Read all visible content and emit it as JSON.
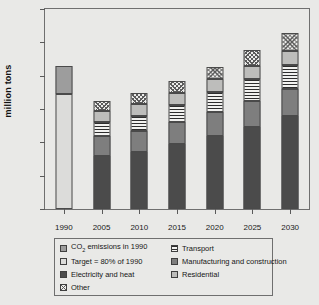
{
  "chart_data": {
    "type": "bar",
    "subtype": "stacked-bar",
    "title": "",
    "xlabel": "",
    "ylabel": "million tons",
    "categories": [
      "1990",
      "2005",
      "2010",
      "2015",
      "2020",
      "2025",
      "2030"
    ],
    "ylim": [
      0,
      6000
    ],
    "ytick_values": [
      0,
      1000,
      2000,
      3000,
      4000,
      5000,
      6000
    ],
    "ytick_labels": [
      "0",
      "1,000",
      "2,000",
      "3,000",
      "4,000",
      "5,000",
      "6,000"
    ],
    "grid": false,
    "legend_position": "bottom",
    "series": [
      {
        "name": "CO2 emissions in 1990",
        "key": "co2_1990",
        "fill": "#9d9d9d",
        "values": [
          860,
          0,
          0,
          0,
          0,
          0,
          0
        ]
      },
      {
        "name": "Target = 80% of 1990",
        "key": "target_80",
        "fill": "#dcdcda",
        "values": [
          3440,
          0,
          0,
          0,
          0,
          0,
          0
        ]
      },
      {
        "name": "Electricity and heat",
        "key": "electricity_heat",
        "fill": "#4b4b4b",
        "values": [
          0,
          1600,
          1710,
          1950,
          2200,
          2470,
          2780
        ]
      },
      {
        "name": "Manufacturing and construction",
        "key": "manufacturing_construction",
        "fill": "#7e7e7e",
        "values": [
          0,
          580,
          620,
          650,
          700,
          780,
          820
        ]
      },
      {
        "name": "Transport",
        "key": "transport",
        "fill": "horizontal-stripes",
        "values": [
          0,
          430,
          470,
          530,
          610,
          650,
          720
        ]
      },
      {
        "name": "Residential",
        "key": "residential",
        "fill": "#bdbdbb",
        "values": [
          0,
          320,
          350,
          360,
          390,
          400,
          410
        ]
      },
      {
        "name": "Other",
        "key": "other",
        "fill": "cross-hatch",
        "values": [
          0,
          300,
          330,
          350,
          370,
          460,
          550
        ]
      }
    ],
    "stack_totals": [
      4300,
      3230,
      3480,
      3840,
      4270,
      4760,
      5280
    ],
    "notes": {
      "1990_bar": "Single bar split into 'Target = 80% of 1990' lower section and 'CO2 emissions in 1990' upper section, total 4,300"
    }
  },
  "legend": {
    "left_column": [
      {
        "label": "CO",
        "sub": "2",
        "label_rest": " emissions in 1990",
        "swatch": "co2_1990"
      },
      {
        "label": "Target = 80% of 1990",
        "swatch": "target_80"
      },
      {
        "label": "Electricity and heat",
        "swatch": "electricity_heat"
      },
      {
        "label": "Other",
        "swatch": "other"
      }
    ],
    "right_column": [
      {
        "label": "Transport",
        "swatch": "transport"
      },
      {
        "label": "Manufacturing and construction",
        "swatch": "manufacturing_construction"
      },
      {
        "label": "Residential",
        "swatch": "residential"
      }
    ]
  },
  "legend_labels": {
    "co2_prefix": "CO",
    "co2_sub": "2",
    "co2_suffix": " emissions in 1990",
    "target": "Target = 80% of 1990",
    "electricity": "Electricity and heat",
    "other": "Other",
    "transport": "Transport",
    "manufacturing": "Manufacturing and construction",
    "residential": "Residential"
  },
  "colors": {
    "background": "#e9e9e7",
    "axis": "#6f6f6f",
    "text": "#1a1a1a"
  }
}
